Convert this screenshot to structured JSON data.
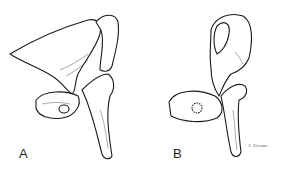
{
  "figure": {
    "panels": [
      {
        "id": "A",
        "label": "A",
        "view": "incus-view-a"
      },
      {
        "id": "B",
        "label": "B",
        "view": "incus-view-b"
      }
    ],
    "signature": "J. Coster",
    "colors": {
      "ink": "#1a1a1a",
      "background": "#ffffff"
    }
  }
}
